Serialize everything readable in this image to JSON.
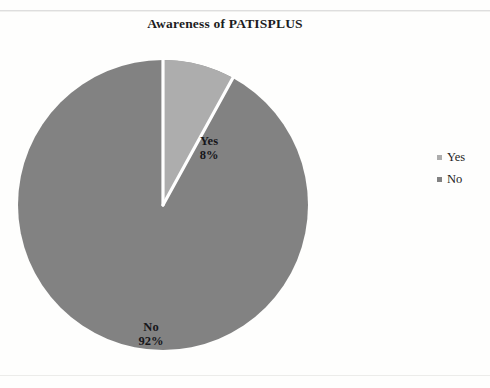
{
  "chart_data": {
    "type": "pie",
    "title": "Awareness of PATISPLUS",
    "xlabel": "",
    "ylabel": "",
    "categories": [
      "Yes",
      "No"
    ],
    "values": [
      8,
      92
    ],
    "value_unit": "percent",
    "slice_labels": [
      "8%",
      "92%"
    ],
    "colors": [
      "#adadad",
      "#828282"
    ],
    "slice_border_color": "#ffffff",
    "start_angle_deg": 0,
    "direction": "clockwise",
    "grid": false,
    "legend_position": "right",
    "slices": [
      {
        "name": "Yes",
        "value": 8,
        "percent_label": "8%",
        "color": "#adadad",
        "start_angle_deg": 0,
        "end_angle_deg": 28.8
      },
      {
        "name": "No",
        "value": 92,
        "percent_label": "92%",
        "color": "#828282",
        "start_angle_deg": 28.8,
        "end_angle_deg": 360
      }
    ],
    "legend": [
      {
        "label": "Yes",
        "color": "#adadad"
      },
      {
        "label": "No",
        "color": "#828282"
      }
    ]
  },
  "legend": {
    "items": [
      {
        "label": "Yes"
      },
      {
        "label": "No"
      }
    ]
  },
  "labels": {
    "yes_name": "Yes",
    "yes_pct": "8%",
    "no_name": "No",
    "no_pct": "92%"
  }
}
